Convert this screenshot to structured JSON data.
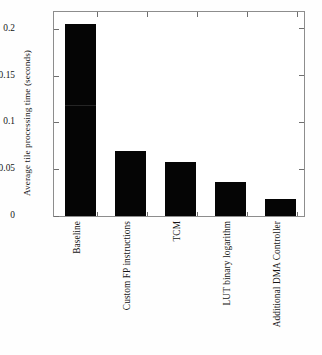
{
  "chart_data": {
    "type": "bar",
    "title": "",
    "xlabel": "",
    "ylabel": "Average tile processing time (seconds)",
    "categories": [
      "Baseline",
      "Custom FP instructions",
      "TCM",
      "LUT binary logarithm",
      "Additional DMA Controller"
    ],
    "values": [
      0.205,
      0.069,
      0.058,
      0.036,
      0.018
    ],
    "ylim": [
      0,
      0.218
    ],
    "yticks": [
      0,
      0.05,
      0.1,
      0.15,
      0.2
    ],
    "ytick_labels": [
      "0",
      "0.05",
      "0.1",
      "0.15",
      "0.2"
    ],
    "grid": false,
    "legend": null,
    "bar_color": "#050505",
    "axis_color": "#8d8d8d",
    "background_color": "#ffffff"
  }
}
